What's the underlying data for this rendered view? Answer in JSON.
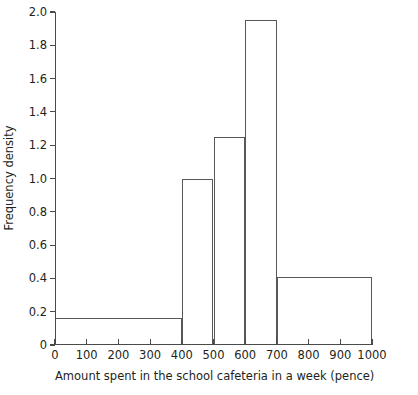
{
  "chart_data": {
    "type": "bar",
    "title": "",
    "subtitle": "",
    "xlabel": "Amount spent in the school cafeteria in a week (pence)",
    "ylabel": "Frequency density",
    "xlim": [
      0,
      1000
    ],
    "ylim": [
      0,
      2.0
    ],
    "grid": false,
    "legend": null,
    "x_ticks": [
      0,
      100,
      200,
      300,
      400,
      500,
      600,
      700,
      800,
      900,
      1000
    ],
    "x_tick_labels": [
      "0",
      "100",
      "200",
      "300",
      "400",
      "500",
      "600",
      "700",
      "800",
      "900",
      "1000"
    ],
    "y_ticks": [
      0,
      0.2,
      0.4,
      0.6,
      0.8,
      1.0,
      1.2,
      1.4,
      1.6,
      1.8,
      2.0
    ],
    "y_tick_labels": [
      "0",
      "0.2",
      "0.4",
      "0.6",
      "0.8",
      "1.0",
      "1.2",
      "1.4",
      "1.6",
      "1.8",
      "2.0"
    ],
    "bins": [
      {
        "label": "0-400",
        "x_start": 0,
        "x_end": 400,
        "value": 0.16
      },
      {
        "label": "400-500",
        "x_start": 400,
        "x_end": 500,
        "value": 1.0
      },
      {
        "label": "500-600",
        "x_start": 500,
        "x_end": 600,
        "value": 1.25
      },
      {
        "label": "600-700",
        "x_start": 600,
        "x_end": 700,
        "value": 1.95
      },
      {
        "label": "700-1000",
        "x_start": 700,
        "x_end": 1000,
        "value": 0.41
      }
    ],
    "categories": [
      "0-400",
      "400-500",
      "500-600",
      "600-700",
      "700-1000"
    ],
    "values": [
      0.16,
      1.0,
      1.25,
      1.95,
      0.41
    ],
    "colors": {
      "bar_outline": "#58585a",
      "axis": "#4a4a4a",
      "text": "#231f20",
      "background": "#ffffff"
    }
  }
}
